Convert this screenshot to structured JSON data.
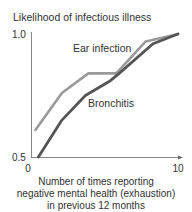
{
  "chart_data": {
    "type": "line",
    "title": "Likelihood of infectious illness",
    "xlabel": "Number of times reporting negative mental health (exhaustion) in previous 12 months",
    "xlabel_lines": [
      "Number of times reporting",
      "negative mental health (exhaustion)",
      "in previous 12 months"
    ],
    "ylabel": "Likelihood of infectious illness",
    "xlim": [
      0,
      10
    ],
    "ylim": [
      0.5,
      1.0
    ],
    "x_ticks": [
      "0",
      "10"
    ],
    "y_ticks": [
      "0.5",
      "1.0"
    ],
    "grid": false,
    "legend": "inline labels",
    "series": [
      {
        "name": "Ear infection",
        "color": "#9a9a9a",
        "points": [
          [
            0.3,
            0.61
          ],
          [
            2.1,
            0.76
          ],
          [
            3.9,
            0.84
          ],
          [
            5.8,
            0.84
          ],
          [
            7.8,
            0.97
          ],
          [
            10,
            1.0
          ]
        ]
      },
      {
        "name": "Bronchitis",
        "color": "#555555",
        "points": [
          [
            0.5,
            0.5
          ],
          [
            2.1,
            0.65
          ],
          [
            3.7,
            0.75
          ],
          [
            5.4,
            0.81
          ],
          [
            6.0,
            0.84
          ],
          [
            8.3,
            0.96
          ],
          [
            10,
            1.0
          ]
        ]
      }
    ]
  },
  "labels": {
    "title": "Likelihood of infectious illness",
    "y_top": "1.0",
    "y_bottom": "0.5",
    "x_left": "0",
    "x_right": "10",
    "series_ear": "Ear infection",
    "series_bronchitis": "Bronchitis",
    "xlabel_1": "Number of times reporting",
    "xlabel_2": "negative mental health (exhaustion)",
    "xlabel_3": "in previous 12 months"
  }
}
